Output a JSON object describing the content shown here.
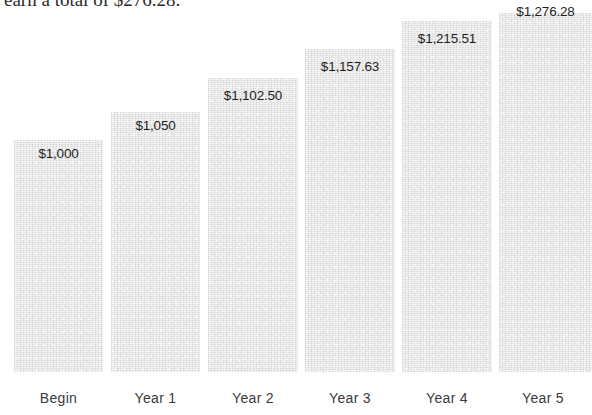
{
  "caption": {
    "clipped_text": "earn a total of $276.28."
  },
  "chart_data": {
    "type": "bar",
    "title": "",
    "subtitle": "",
    "xlabel": "",
    "ylabel": "",
    "grid": false,
    "legend": false,
    "currency": "USD",
    "categories": [
      "Begin",
      "Year 1",
      "Year 2",
      "Year 3",
      "Year 4",
      "Year 5"
    ],
    "values": [
      1000,
      1050,
      1102.5,
      1157.63,
      1215.51,
      1276.28
    ],
    "value_labels": [
      "$1,000",
      "$1,050",
      "$1,102.50",
      "$1,157.63",
      "$1,215.51",
      "$1,276.28"
    ],
    "ylim": [
      0,
      1390
    ],
    "bar_color": "#dedede",
    "label_color": "#1f1f1f",
    "axis_label_color": "#3a3a3a",
    "label_placement": [
      "above-bar",
      "above-bar",
      "above-bar",
      "above-bar",
      "above-bar",
      "inside-top"
    ]
  },
  "bars": [
    {
      "category": "Begin",
      "value_label": "$1,000",
      "left": 14,
      "width": 89,
      "top": 140,
      "label_top": 146,
      "label_inside": false
    },
    {
      "category": "Year 1",
      "value_label": "$1,050",
      "left": 111,
      "width": 89,
      "top": 112,
      "label_top": 118,
      "label_inside": false
    },
    {
      "category": "Year 2",
      "value_label": "$1,102.50",
      "left": 208,
      "width": 90,
      "top": 78,
      "label_top": 88,
      "label_inside": false
    },
    {
      "category": "Year 3",
      "value_label": "$1,157.63",
      "left": 305,
      "width": 90,
      "top": 49,
      "label_top": 59,
      "label_inside": false
    },
    {
      "category": "Year 4",
      "value_label": "$1,215.51",
      "left": 402,
      "width": 90,
      "top": 21,
      "label_top": 31,
      "label_inside": false
    },
    {
      "category": "Year 5",
      "value_label": "$1,276.28",
      "left": 499,
      "width": 93,
      "top": 13,
      "label_top": 4,
      "label_inside": true
    }
  ],
  "axis": {
    "labels": [
      {
        "text": "Begin",
        "left": 14,
        "width": 89
      },
      {
        "text": "Year 1",
        "left": 111,
        "width": 89
      },
      {
        "text": "Year 2",
        "left": 208,
        "width": 90
      },
      {
        "text": "Year 3",
        "left": 305,
        "width": 90
      },
      {
        "text": "Year 4",
        "left": 402,
        "width": 90
      },
      {
        "text": "Year 5",
        "left": 499,
        "width": 88
      }
    ]
  }
}
